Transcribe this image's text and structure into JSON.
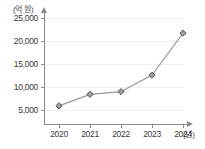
{
  "chart_data": {
    "type": "line",
    "title": "",
    "subtitle": "",
    "xlabel": "(년)",
    "ylabel": "(억 원)",
    "categories": [
      "2020",
      "2021",
      "2022",
      "2023",
      "2024"
    ],
    "values": [
      5900,
      8400,
      9000,
      12600,
      21700
    ],
    "series": [
      {
        "name": "",
        "values": [
          5900,
          8400,
          9000,
          12600,
          21700
        ]
      }
    ],
    "ylim": [
      3500,
      26500
    ],
    "yticks": [
      5000,
      10000,
      15000,
      20000,
      25000
    ],
    "ytick_labels": [
      "5,000",
      "10,000",
      "15,000",
      "20,000",
      "25,000"
    ],
    "xtick_labels": [
      "2020",
      "2021",
      "2022",
      "2023",
      "2024"
    ],
    "grid": true,
    "grid_axis": "y",
    "legend": false,
    "legend_position": "none",
    "marker": "diamond",
    "annotations": []
  },
  "style": {
    "line_color": "#9a9a9a",
    "marker_fill": "#9d9d9d",
    "marker_stroke": "#4d4d4d",
    "grid_color": "#f0f0f0",
    "axis_color": "#8a8a8a",
    "text_color": "#3a3a3a",
    "background": "#ffffff"
  }
}
